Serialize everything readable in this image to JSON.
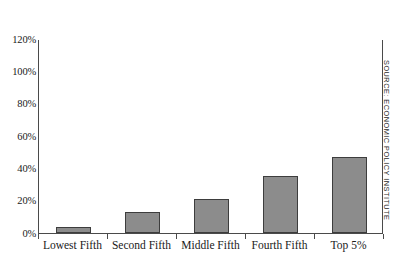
{
  "chart_data": {
    "type": "bar",
    "title": "",
    "subtitle": "",
    "xlabel": "",
    "ylabel": "",
    "categories": [
      "Lowest Fifth",
      "Second Fifth",
      "Middle Fifth",
      "Fourth Fifth",
      "Top 5%"
    ],
    "values": [
      4,
      13,
      21,
      35,
      47
    ],
    "value_unit": "%",
    "ylim": [
      0,
      120
    ],
    "ytick_labels": [
      "120%",
      "100%",
      "80%",
      "60%",
      "40%",
      "20%",
      "0%"
    ],
    "ytick_values": [
      120,
      100,
      80,
      60,
      40,
      20,
      0
    ],
    "grid": false,
    "legend": null,
    "legend_position": "none",
    "annotations": [
      {
        "name": "source-credit",
        "text": "SOURCE: ECONOMIC POLICY INSTITUTE",
        "orientation": "vertical",
        "position": "right-margin"
      }
    ],
    "colors": {
      "bar_fill": "#8c8c8c",
      "bar_edge": "#3d3d3d",
      "axis": "#4a4a4a",
      "text": "#1a1a1a",
      "background": "#ffffff"
    }
  }
}
